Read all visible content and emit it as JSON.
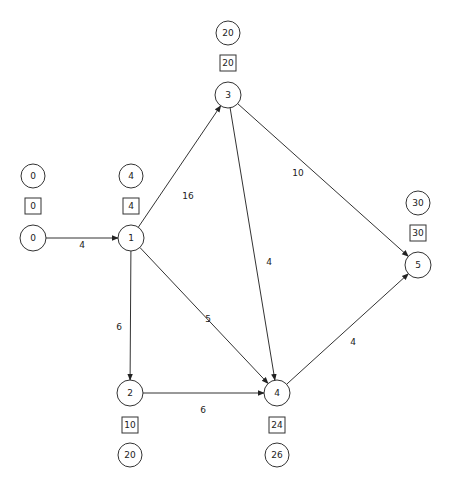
{
  "diagram": {
    "type": "activity-on-node network (critical path)",
    "nodes": [
      {
        "id": "0",
        "label": "0",
        "early": "0",
        "late": "0",
        "x": 33,
        "y": 238,
        "early_pos": "above",
        "late_pos": "above"
      },
      {
        "id": "1",
        "label": "1",
        "early": "4",
        "late": "4",
        "x": 131,
        "y": 238,
        "early_pos": "above",
        "late_pos": "above"
      },
      {
        "id": "2",
        "label": "2",
        "early": "10",
        "late": "20",
        "x": 130,
        "y": 393,
        "early_pos": "below",
        "late_pos": "below"
      },
      {
        "id": "3",
        "label": "3",
        "early": "20",
        "late": "20",
        "x": 228,
        "y": 95,
        "early_pos": "above",
        "late_pos": "above"
      },
      {
        "id": "4",
        "label": "4",
        "early": "24",
        "late": "26",
        "x": 277,
        "y": 393,
        "early_pos": "below",
        "late_pos": "below"
      },
      {
        "id": "5",
        "label": "5",
        "early": "30",
        "late": "30",
        "x": 418,
        "y": 265,
        "early_pos": "above",
        "late_pos": "above"
      }
    ],
    "edges": [
      {
        "from": "0",
        "to": "1",
        "weight": "4",
        "lx": 82,
        "ly": 248
      },
      {
        "from": "1",
        "to": "3",
        "weight": "16",
        "lx": 188,
        "ly": 199
      },
      {
        "from": "1",
        "to": "2",
        "weight": "6",
        "lx": 119,
        "ly": 330
      },
      {
        "from": "1",
        "to": "4",
        "weight": "5",
        "lx": 208,
        "ly": 322
      },
      {
        "from": "3",
        "to": "4",
        "weight": "4",
        "lx": 269,
        "ly": 265
      },
      {
        "from": "3",
        "to": "5",
        "weight": "10",
        "lx": 298,
        "ly": 176
      },
      {
        "from": "2",
        "to": "4",
        "weight": "6",
        "lx": 203,
        "ly": 413
      },
      {
        "from": "4",
        "to": "5",
        "weight": "4",
        "lx": 353,
        "ly": 345
      }
    ]
  }
}
